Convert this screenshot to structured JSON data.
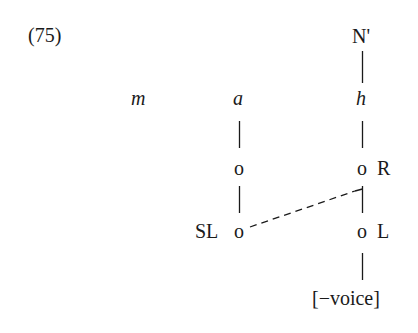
{
  "example": {
    "number": "(75)"
  },
  "tree": {
    "top_node": "N'",
    "segments": [
      {
        "label": "m",
        "italic": true
      },
      {
        "label": "a",
        "italic": true
      },
      {
        "label": "h",
        "italic": true
      }
    ],
    "a_branch": {
      "root": "o",
      "sl": {
        "node": "o",
        "label": "SL"
      }
    },
    "h_branch": {
      "root": {
        "node": "o",
        "label": "R"
      },
      "laryngeal": {
        "node": "o",
        "label": "L"
      },
      "feature": "[−voice]"
    },
    "association": {
      "type": "dashed",
      "from": "SL node under a",
      "to": "R-L link under h"
    }
  }
}
